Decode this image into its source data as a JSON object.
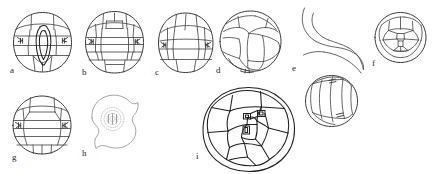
{
  "plate": {
    "title": "",
    "caption": "",
    "background_color": "#ffffff",
    "ink_color": "#4a4a4a",
    "dark_ink_color": "#1f1f1f",
    "faint_ink_color": "#8d8d8d",
    "label_color": "#262626",
    "width": 435,
    "height": 174,
    "panel_count": 9
  },
  "panels": [
    {
      "id": "a",
      "label": "a",
      "label_x": 10,
      "label_y": 72,
      "description": "ovoid grain, frontal view, with elongate central furrow and transverse wall tiers",
      "row": 1,
      "column": 1
    },
    {
      "id": "b",
      "label": "b",
      "label_x": 82,
      "label_y": 74,
      "description": "ovoid grain with tiered polygonal plates and paired lateral pore marks",
      "row": 1,
      "column": 2
    },
    {
      "id": "c",
      "label": "c",
      "label_x": 155,
      "label_y": 74,
      "description": "ovoid grain, oblique view, upper dome divided into three plates",
      "row": 1,
      "column": 3
    },
    {
      "id": "d",
      "label": "d",
      "label_x": 216,
      "label_y": 72,
      "description": "round grain with large central polygonal plate and basal lobes",
      "row": 1,
      "column": 4
    },
    {
      "id": "e",
      "label": "e",
      "label_x": 292,
      "label_y": 70,
      "description": "detached elongate appendage above a round plated grain",
      "row": 1,
      "column": 5
    },
    {
      "id": "f",
      "label": "f",
      "label_x": 372,
      "label_y": 65,
      "description": "circular grain, polar view, with small central cells",
      "row": 1,
      "column": 6
    },
    {
      "id": "g",
      "label": "g",
      "label_x": 12,
      "label_y": 159,
      "description": "round grain with broad equatorial band and lateral pore marks",
      "row": 2,
      "column": 1
    },
    {
      "id": "h",
      "label": "h",
      "label_x": 82,
      "label_y": 155,
      "description": "lightly drawn lobed outline enclosing a small stippled disc",
      "row": 2,
      "column": 2
    },
    {
      "id": "i",
      "label": "i",
      "label_x": 196,
      "label_y": 158,
      "description": "large rounded grain, polar view, with numerous polygonal plates and two small central cells",
      "row": 2,
      "column": 3
    }
  ]
}
